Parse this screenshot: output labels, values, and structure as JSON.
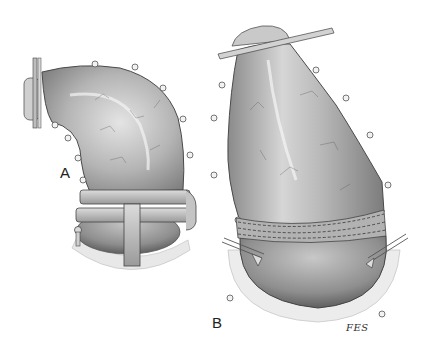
{
  "figure": {
    "panels": [
      {
        "id": "A",
        "label": "A",
        "description": "Curved tubular organ segment clamped at base with T-shaped clamp; rod at left end"
      },
      {
        "id": "B",
        "label": "B",
        "description": "Larger organ segment with rod clamp at top, stapled/sutured junction line, retraction sutures at sides"
      }
    ],
    "signature": "FES"
  },
  "colors": {
    "background": "#ffffff",
    "tissue_light": "#d9d9d9",
    "tissue_mid": "#a8a8a8",
    "tissue_dark": "#6e6e6e",
    "outline": "#4a4a4a",
    "clamp": "#bcbcbc"
  }
}
